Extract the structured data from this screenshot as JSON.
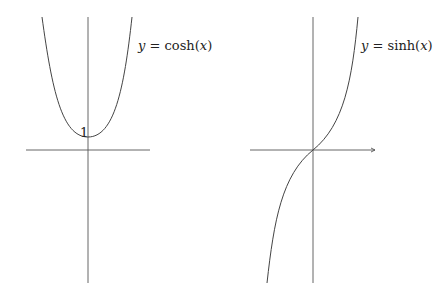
{
  "figures": [
    {
      "id": "cosh",
      "label_y": "y",
      "label_eq": "=",
      "label_fn": "cosh(",
      "label_x": "x",
      "label_close": ")",
      "label_full": "y = cosh(x)",
      "intercept_label": "1"
    },
    {
      "id": "sinh",
      "label_y": "y",
      "label_eq": "=",
      "label_fn": "sinh(",
      "label_x": "x",
      "label_close": ")",
      "label_full": "y = sinh(x)"
    }
  ],
  "colors": {
    "axis": "#555555",
    "curve": "#444444",
    "background": "#ffffff"
  }
}
